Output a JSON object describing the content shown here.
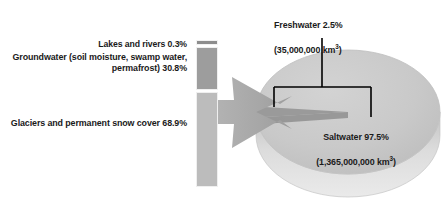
{
  "chart_data": {
    "type": "pie",
    "title": "",
    "subtitle": "",
    "xlabel": "",
    "ylabel": "",
    "legend_position": "none",
    "grid": false,
    "pie": {
      "type": "pie",
      "categories": [
        "Saltwater",
        "Freshwater"
      ],
      "values": [
        97.5,
        2.5
      ],
      "units": "%",
      "volumes_km3": [
        1365000000,
        35000000
      ],
      "labels": [
        "Saltwater 97.5%\n(1,365,000,000 km3)",
        "Freshwater 2.5%\n(35,000,000 km3)"
      ],
      "colors": [
        "#c9c9c9",
        "#9a9a9a"
      ]
    },
    "bar": {
      "type": "bar",
      "orientation": "vertical-stacked",
      "note": "Breakdown of the 2.5% freshwater share (sums to 100% of freshwater)",
      "categories": [
        "Lakes and rivers",
        "Groundwater (soil moisture, swamp water, permafrost)",
        "Glaciers and permanent snow cover"
      ],
      "values": [
        0.3,
        30.8,
        68.9
      ],
      "units": "%",
      "colors": [
        "#8d8d8d",
        "#9d9d9d",
        "#bcbcbc"
      ],
      "ylim": [
        0,
        100
      ]
    }
  },
  "labels": {
    "lakes": "Lakes and rivers 0.3%",
    "groundwater": "Groundwater (soil moisture, swamp water, permafrost) 30.8%",
    "glaciers": "Glaciers and permanent snow cover 68.9%",
    "freshwater_line1": "Freshwater 2.5%",
    "freshwater_line2_open": "(35,000,000 km",
    "freshwater_sup": "3",
    "freshwater_line2_close": ")",
    "saltwater_line1": "Saltwater 97.5%",
    "saltwater_line2_open": "(1,365,000,000 km",
    "saltwater_sup": "3",
    "saltwater_line2_close": ")"
  },
  "colors": {
    "pie_top": "#c9c9c9",
    "pie_rim": "#d8d8d8",
    "pie_slice": "#9a9a9a",
    "arrow": "#a9a9a9",
    "bar_lakes": "#8d8d8d",
    "bar_groundwater": "#9d9d9d",
    "bar_glaciers": "#bcbcbc",
    "callout_line": "#000000",
    "text": "#1a1a1a",
    "background": "#ffffff"
  }
}
